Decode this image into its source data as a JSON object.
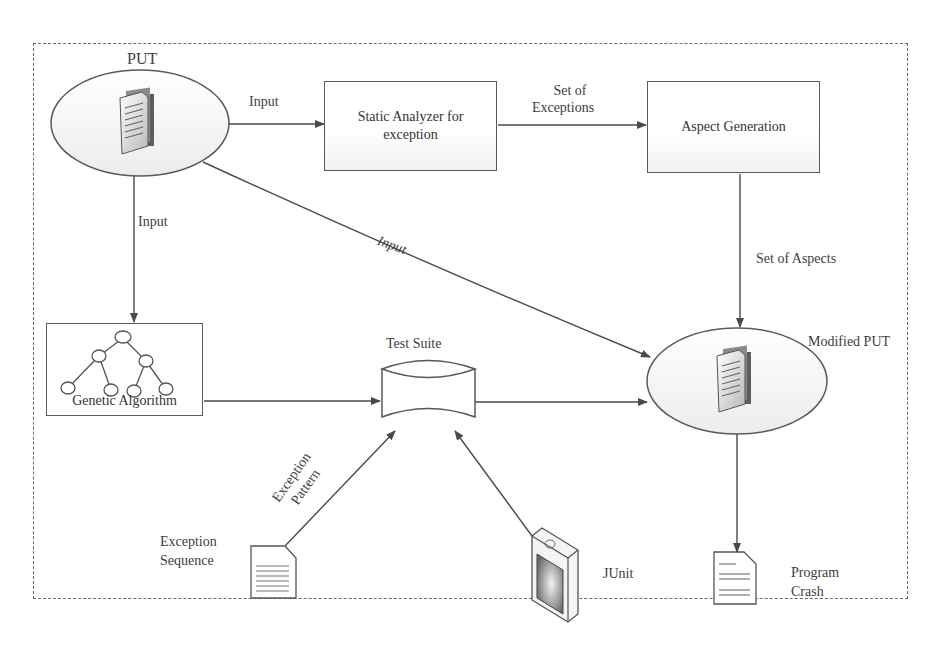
{
  "diagram": {
    "nodes": {
      "put": {
        "label": "PUT",
        "shape": "ellipse",
        "icon": "documents-icon"
      },
      "static_analyzer": {
        "label_line1": "Static Analyzer for",
        "label_line2": "exception",
        "shape": "rectangle"
      },
      "aspect_generation": {
        "label": "Aspect Generation",
        "shape": "rectangle"
      },
      "genetic_algorithm": {
        "label": "Genetic Algorithm",
        "shape": "rectangle",
        "icon": "tree-icon"
      },
      "test_suite": {
        "label": "Test Suite",
        "shape": "cylinder"
      },
      "modified_put": {
        "label": "Modified PUT",
        "shape": "ellipse",
        "icon": "documents-icon"
      },
      "exception_sequence": {
        "label_line1": "Exception",
        "label_line2": "Sequence",
        "icon": "document-icon"
      },
      "junit": {
        "label": "JUnit",
        "icon": "junit-device-icon"
      },
      "program_crash": {
        "label_line1": "Program",
        "label_line2": "Crash",
        "icon": "document-icon"
      }
    },
    "edges": [
      {
        "from": "put",
        "to": "static_analyzer",
        "label": "Input"
      },
      {
        "from": "static_analyzer",
        "to": "aspect_generation",
        "label_line1": "Set of",
        "label_line2": "Exceptions"
      },
      {
        "from": "aspect_generation",
        "to": "modified_put",
        "label": "Set of Aspects"
      },
      {
        "from": "put",
        "to": "genetic_algorithm",
        "label": "Input"
      },
      {
        "from": "put",
        "to": "modified_put",
        "label": "Input"
      },
      {
        "from": "genetic_algorithm",
        "to": "test_suite",
        "label": ""
      },
      {
        "from": "test_suite",
        "to": "modified_put",
        "label": ""
      },
      {
        "from": "exception_sequence",
        "to": "test_suite",
        "label_line1": "Exception",
        "label_line2": "Pattern"
      },
      {
        "from": "junit",
        "to": "test_suite",
        "label": ""
      },
      {
        "from": "modified_put",
        "to": "program_crash",
        "label": ""
      }
    ],
    "colors": {
      "line": "#4a4a4a",
      "frame": "#6a6a6a",
      "text": "#3d3d3d",
      "fill": "#ffffff"
    }
  }
}
